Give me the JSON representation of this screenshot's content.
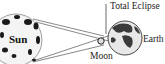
{
  "diagram": {
    "title": "Total Eclipse",
    "labels": {
      "sun": "Sun",
      "moon": "Moon",
      "earth": "Earth",
      "total_eclipse": "Total Eclipse"
    },
    "colors": {
      "line": "#555555",
      "sun_fill": "#f4f4f4",
      "sun_spots": "#1a1a1a",
      "earth_fill": "#e8e8e8",
      "earth_land": "#3a3a3a",
      "moon_fill": "#dddddd"
    }
  }
}
